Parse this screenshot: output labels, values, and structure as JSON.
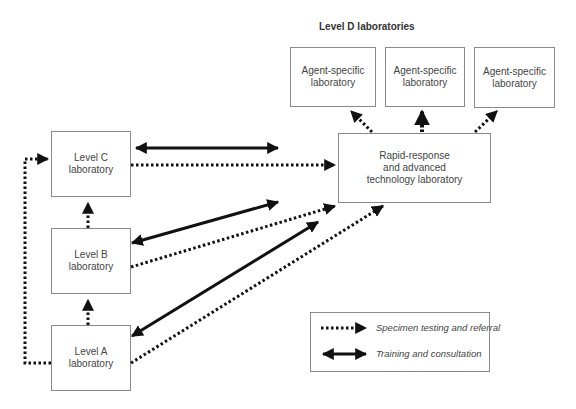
{
  "title": "Level D laboratories",
  "nodes": {
    "agent1": {
      "line1": "Agent-specific",
      "line2": "laboratory"
    },
    "agent2": {
      "line1": "Agent-specific",
      "line2": "laboratory"
    },
    "agent3": {
      "line1": "Agent-specific",
      "line2": "laboratory"
    },
    "rapid": {
      "line1": "Rapid-response",
      "line2": "and advanced",
      "line3": "technology laboratory"
    },
    "levelC": {
      "line1": "Level C",
      "line2": "laboratory"
    },
    "levelB": {
      "line1": "Level B",
      "line2": "laboratory"
    },
    "levelA": {
      "line1": "Level A",
      "line2": "laboratory"
    }
  },
  "edges": [
    {
      "from": "levelC",
      "to": "rapid",
      "type": "specimen"
    },
    {
      "from": "levelB",
      "to": "rapid",
      "type": "specimen"
    },
    {
      "from": "levelA",
      "to": "rapid",
      "type": "specimen"
    },
    {
      "from": "levelA",
      "to": "levelB",
      "type": "specimen"
    },
    {
      "from": "levelB",
      "to": "levelC",
      "type": "specimen"
    },
    {
      "from": "levelA",
      "to": "levelC",
      "type": "specimen"
    },
    {
      "from": "rapid",
      "to": "agent1",
      "type": "specimen"
    },
    {
      "from": "rapid",
      "to": "agent2",
      "type": "specimen"
    },
    {
      "from": "rapid",
      "to": "agent3",
      "type": "specimen"
    },
    {
      "from": "levelC",
      "to": "rapid",
      "type": "training"
    },
    {
      "from": "levelB",
      "to": "rapid",
      "type": "training"
    },
    {
      "from": "levelA",
      "to": "rapid",
      "type": "training"
    }
  ],
  "legend": {
    "specimen": "Specimen testing and referral",
    "training": "Training and consultation"
  }
}
